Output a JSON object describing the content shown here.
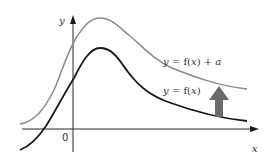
{
  "diagram": {
    "type": "function-graph-translation",
    "axes": {
      "x_label": "x",
      "y_label": "y",
      "origin_label": "0"
    },
    "curves": [
      {
        "name": "f(x)",
        "label_prefix": "y = f(",
        "label_var": "x",
        "label_suffix": ")",
        "color": "#1a1a1a"
      },
      {
        "name": "f(x) + a",
        "label_prefix": "y = f(",
        "label_var": "x",
        "label_suffix": ") + ",
        "label_const": "a",
        "color": "#8a8a8a"
      }
    ],
    "arrow": {
      "direction": "up",
      "meaning": "vertical translation by a",
      "color": "#6b6b6b"
    }
  }
}
